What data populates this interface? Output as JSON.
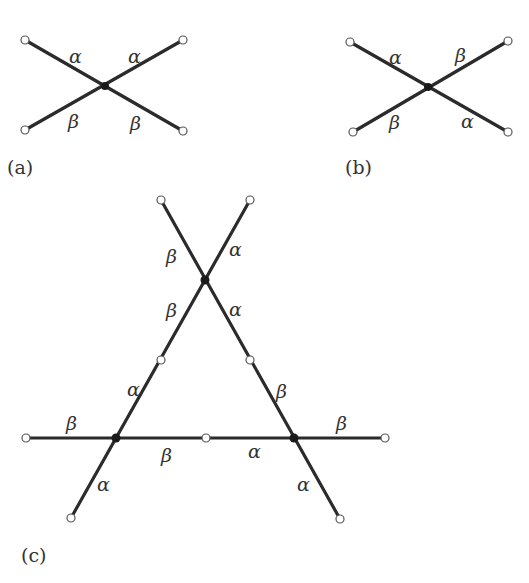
{
  "panels": {
    "a": {
      "caption": "(a)",
      "labels": [
        "α",
        "α",
        "β",
        "β"
      ]
    },
    "b": {
      "caption": "(b)",
      "labels": [
        "α",
        "β",
        "β",
        "α"
      ]
    },
    "c": {
      "caption": "(c)",
      "labels": [
        "β",
        "α",
        "β",
        "α",
        "α",
        "β",
        "β",
        "β",
        "β",
        "α",
        "α",
        "α"
      ]
    }
  },
  "colors": {
    "edge": "#2b2b2b",
    "vertex_filled": "#1a1a1a",
    "vertex_open": "#ffffff",
    "background": "#ffffff"
  }
}
